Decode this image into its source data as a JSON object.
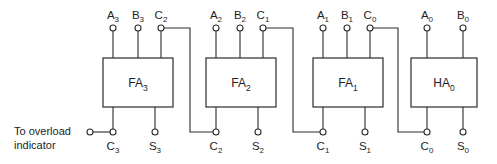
{
  "diagram": {
    "line_color": "#2b2b2b",
    "background": "#ffffff",
    "note": {
      "line1": "To overload",
      "line2": "indicator"
    },
    "blocks": [
      {
        "id": "fa3",
        "label_main": "FA",
        "label_sub": "3",
        "x": 103,
        "y": 58,
        "w": 70,
        "h": 49,
        "inputs": [
          {
            "name": "A3",
            "main": "A",
            "sub": "3",
            "cx": 113
          },
          {
            "name": "B3",
            "main": "B",
            "sub": "3",
            "cx": 138
          },
          {
            "name": "C2",
            "main": "C",
            "sub": "2",
            "cx": 161
          }
        ],
        "outputs": [
          {
            "name": "C3",
            "main": "C",
            "sub": "3",
            "cx": 113
          },
          {
            "name": "S3",
            "main": "S",
            "sub": "3",
            "cx": 155
          }
        ]
      },
      {
        "id": "fa2",
        "label_main": "FA",
        "label_sub": "2",
        "x": 206,
        "y": 58,
        "w": 70,
        "h": 49,
        "inputs": [
          {
            "name": "A2",
            "main": "A",
            "sub": "2",
            "cx": 216
          },
          {
            "name": "B2",
            "main": "B",
            "sub": "2",
            "cx": 240
          },
          {
            "name": "C1",
            "main": "C",
            "sub": "1",
            "cx": 263
          }
        ],
        "outputs": [
          {
            "name": "C2",
            "main": "C",
            "sub": "2",
            "cx": 216
          },
          {
            "name": "S2",
            "main": "S",
            "sub": "2",
            "cx": 258
          }
        ]
      },
      {
        "id": "fa1",
        "label_main": "FA",
        "label_sub": "1",
        "x": 313,
        "y": 58,
        "w": 70,
        "h": 49,
        "inputs": [
          {
            "name": "A1",
            "main": "A",
            "sub": "1",
            "cx": 323
          },
          {
            "name": "B1",
            "main": "B",
            "sub": "1",
            "cx": 347
          },
          {
            "name": "C0",
            "main": "C",
            "sub": "0",
            "cx": 370
          }
        ],
        "outputs": [
          {
            "name": "C1",
            "main": "C",
            "sub": "1",
            "cx": 323
          },
          {
            "name": "S1",
            "main": "S",
            "sub": "1",
            "cx": 365
          }
        ]
      },
      {
        "id": "ha0",
        "label_main": "HA",
        "label_sub": "0",
        "x": 411,
        "y": 58,
        "w": 66,
        "h": 49,
        "inputs": [
          {
            "name": "A0",
            "main": "A",
            "sub": "0",
            "cx": 427
          },
          {
            "name": "B0",
            "main": "B",
            "sub": "0",
            "cx": 463
          }
        ],
        "outputs": [
          {
            "name": "C0",
            "main": "C",
            "sub": "0",
            "cx": 427
          },
          {
            "name": "S0",
            "main": "S",
            "sub": "0",
            "cx": 463
          }
        ]
      }
    ],
    "overload_terminal": {
      "cx": 90,
      "cy": 132
    },
    "carry_chain": [
      {
        "from": "C2-out-of-fa2",
        "to": "C2-in-of-fa3"
      },
      {
        "from": "C1-out-of-fa1",
        "to": "C1-in-of-fa2"
      },
      {
        "from": "C0-out-of-ha0",
        "to": "C0-in-of-fa1"
      }
    ],
    "terminal_radius": 3,
    "top_terminal_y": 28,
    "bottom_terminal_y": 132
  }
}
